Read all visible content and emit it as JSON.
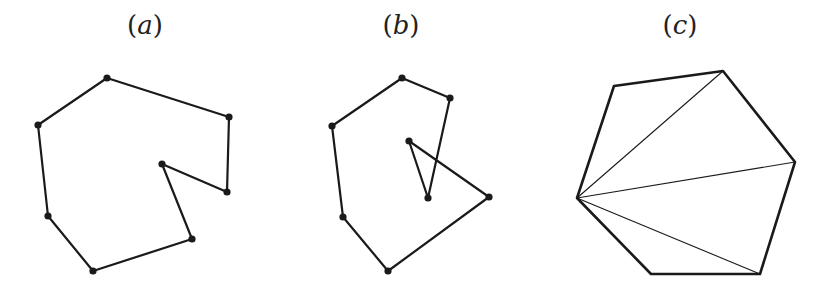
{
  "figures": [
    {
      "id": "a",
      "label": "(a)",
      "label_letter": "a",
      "label_x": 145,
      "type": "non-convex polygon (simple)",
      "vertices": [
        [
          107,
          78
        ],
        [
          229,
          117
        ],
        [
          227,
          192
        ],
        [
          162,
          164
        ],
        [
          192,
          239
        ],
        [
          93,
          271
        ],
        [
          48,
          216
        ],
        [
          38,
          125
        ]
      ],
      "show_vertices": true
    },
    {
      "id": "b",
      "label": "(b)",
      "label_letter": "b",
      "label_x": 401,
      "type": "self-intersecting polygon",
      "vertices": [
        [
          402,
          78
        ],
        [
          450,
          98
        ],
        [
          428,
          198
        ],
        [
          409,
          141
        ],
        [
          489,
          197
        ],
        [
          388,
          271
        ],
        [
          343,
          217
        ],
        [
          332,
          126
        ]
      ],
      "show_vertices": true
    },
    {
      "id": "c",
      "label": "(c)",
      "label_letter": "c",
      "label_x": 680,
      "type": "convex hexagon triangulation",
      "vertices": [
        [
          614,
          86
        ],
        [
          723,
          71
        ],
        [
          795,
          162
        ],
        [
          760,
          274
        ],
        [
          651,
          274
        ],
        [
          577,
          198
        ]
      ],
      "show_vertices": false,
      "diagonals_from": [
        577,
        198
      ],
      "diagonals_to": [
        [
          723,
          71
        ],
        [
          795,
          162
        ],
        [
          760,
          274
        ]
      ]
    }
  ],
  "colors": {
    "stroke": "#1a1a1a",
    "background": "#ffffff"
  }
}
